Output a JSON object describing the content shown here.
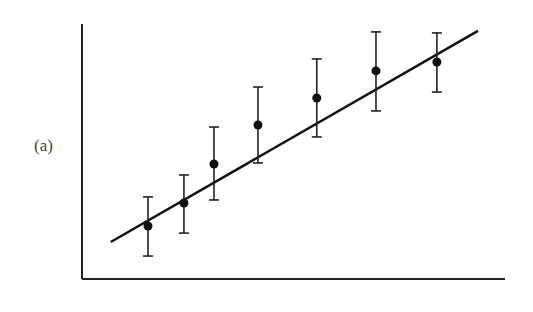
{
  "panel_label": "(a)",
  "colors": {
    "axis": "#222222",
    "points": "#111111",
    "fit_line": "#111111",
    "error_bars": "#222222",
    "background": "#ffffff"
  },
  "chart_data": {
    "type": "scatter",
    "title": "",
    "panel": "(a)",
    "xlabel": "",
    "ylabel": "",
    "xlim": [
      0,
      10
    ],
    "ylim": [
      0,
      10
    ],
    "grid": false,
    "legend": null,
    "axes_ticks": "none (unlabeled axes)",
    "series": [
      {
        "name": "data",
        "marker": "filled circle",
        "error_bars": true,
        "x": [
          1.56,
          2.41,
          3.12,
          4.16,
          5.55,
          6.95,
          8.39
        ],
        "y": [
          2.08,
          2.98,
          4.51,
          6.04,
          7.1,
          8.16,
          8.51
        ],
        "y_err_upper": [
          1.14,
          1.1,
          1.45,
          1.49,
          1.53,
          1.53,
          1.14
        ],
        "y_err_lower": [
          1.18,
          1.18,
          1.41,
          1.49,
          1.53,
          1.57,
          1.18
        ]
      },
      {
        "name": "linear fit",
        "type": "line",
        "x": [
          0.68,
          9.36
        ],
        "y": [
          1.45,
          9.73
        ]
      }
    ]
  }
}
